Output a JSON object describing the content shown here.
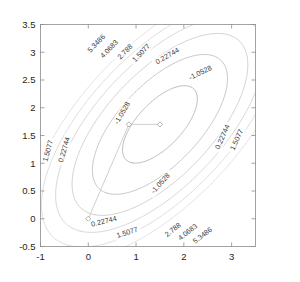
{
  "figure": {
    "title": "",
    "background_color": "#ffffff",
    "axis_color": "#8d8d8d",
    "label_color": "#262626"
  },
  "chart_data": {
    "type": "line",
    "plot_kind": "contour",
    "title": "",
    "xlabel": "",
    "ylabel": "",
    "xlim": [
      -1,
      3.5
    ],
    "ylim": [
      -0.5,
      3.5
    ],
    "xticks": [
      "-1",
      "0",
      "1",
      "2",
      "3"
    ],
    "xtick_values": [
      -1,
      0,
      1,
      2,
      3
    ],
    "yticks": [
      "-0.5",
      "0",
      "0.5",
      "1",
      "1.5",
      "2",
      "2.5",
      "3",
      "3.5"
    ],
    "ytick_values": [
      -0.5,
      0,
      0.5,
      1,
      1.5,
      2,
      2.5,
      3,
      3.5
    ],
    "grid": false,
    "legend": "none",
    "contour_levels": [
      -1.0528,
      0.22744,
      1.5077,
      2.788,
      4.0683,
      5.3486
    ],
    "contour_labels": [
      "-1.0528",
      "0.22744",
      "1.5077",
      "2.788",
      "4.0683",
      "5.3486"
    ],
    "contour_color": "#b9b9b9",
    "minimum_estimate": [
      1.5,
      1.7
    ],
    "series": [
      {
        "name": "iterate-path",
        "marker": "diamond",
        "color": "#c9c9c9",
        "x": [
          0.0,
          0.85,
          1.5
        ],
        "y": [
          0.0,
          1.7,
          1.7
        ]
      }
    ],
    "annotations": [
      {
        "text": "5.3486",
        "x": 0.18,
        "y": 3.15,
        "rotation": -46
      },
      {
        "text": "4.0683",
        "x": 0.45,
        "y": 3.05,
        "rotation": -46
      },
      {
        "text": "2.788",
        "x": 0.78,
        "y": 3.0,
        "rotation": -46
      },
      {
        "text": "1.5077",
        "x": 1.12,
        "y": 2.98,
        "rotation": -46
      },
      {
        "text": "0.22744",
        "x": 1.66,
        "y": 2.92,
        "rotation": -30
      },
      {
        "text": "-1.0528",
        "x": 2.35,
        "y": 2.62,
        "rotation": -26
      },
      {
        "text": "-1.0528",
        "x": 0.72,
        "y": 1.9,
        "rotation": -60
      },
      {
        "text": "-1.0528",
        "x": 1.52,
        "y": 0.63,
        "rotation": -48
      },
      {
        "text": "1.5077",
        "x": -0.83,
        "y": 1.22,
        "rotation": -74
      },
      {
        "text": "0.22744",
        "x": -0.49,
        "y": 1.24,
        "rotation": -74
      },
      {
        "text": "0.22744",
        "x": 0.33,
        "y": -0.06,
        "rotation": -14
      },
      {
        "text": "1.5077",
        "x": 0.82,
        "y": -0.26,
        "rotation": -18
      },
      {
        "text": "0.22744",
        "x": 2.82,
        "y": 1.47,
        "rotation": -66
      },
      {
        "text": "1.5077",
        "x": 3.12,
        "y": 1.42,
        "rotation": -66
      },
      {
        "text": "2.788",
        "x": 1.78,
        "y": -0.21,
        "rotation": -38
      },
      {
        "text": "4.0683",
        "x": 2.09,
        "y": -0.25,
        "rotation": -38
      },
      {
        "text": "5.3486",
        "x": 2.4,
        "y": -0.31,
        "rotation": -38
      }
    ]
  }
}
